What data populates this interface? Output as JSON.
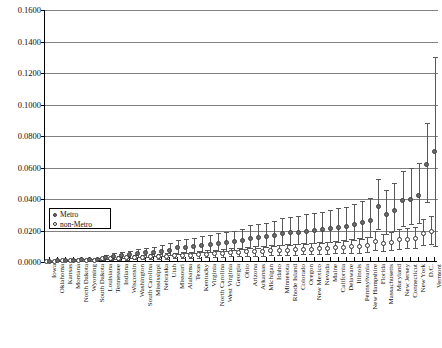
{
  "chart_data": {
    "type": "scatter",
    "title": "",
    "xlabel": "",
    "ylabel": "",
    "ylim": [
      0.0,
      0.16
    ],
    "yticks": [
      0.0,
      0.02,
      0.04,
      0.06,
      0.08,
      0.1,
      0.12,
      0.14,
      0.16
    ],
    "ytick_labels": [
      "0.0000",
      "0.0200",
      "0.0400",
      "0.0600",
      "0.0800",
      "0.1000",
      "0.1200",
      "0.1400",
      "0.1600"
    ],
    "grid": true,
    "legend_position": "inner-left",
    "legend": [
      "Metro",
      "non-Metro"
    ],
    "categories": [
      "Iowa",
      "Oklahoma",
      "Kansas",
      "Montana",
      "North Dakota",
      "Wyoming",
      "South Dakota",
      "Louisiana",
      "Tennessee",
      "Indiana",
      "Wisconsin",
      "Washington",
      "South Carolina",
      "Mississippi",
      "Nebraska",
      "Utah",
      "Missouri",
      "Alabama",
      "Texas",
      "Kentucky",
      "Virginia",
      "North Carolina",
      "West Virginia",
      "Georgia",
      "Ohio",
      "Arizona",
      "Arkansas",
      "Michigan",
      "Idaho",
      "Minnesota",
      "Rhode Island",
      "Colorado",
      "Oregon",
      "New Mexico",
      "Nevada",
      "Maine",
      "California",
      "Delaware",
      "Illinois",
      "Pennsylvania",
      "New Hampshire",
      "Florida",
      "Massachusetts",
      "Maryland",
      "New Jersey",
      "Connecticut",
      "New York",
      "D.C.",
      "Vermont"
    ],
    "series": [
      {
        "name": "Metro",
        "marker": "filled-circle",
        "color": "#6b6b6b",
        "values": [
          0.0005,
          0.0008,
          0.001,
          0.0012,
          0.0013,
          0.0015,
          0.0016,
          0.003,
          0.0035,
          0.004,
          0.0045,
          0.0052,
          0.0058,
          0.0062,
          0.0068,
          0.0075,
          0.009,
          0.0095,
          0.01,
          0.0105,
          0.0112,
          0.0118,
          0.0122,
          0.013,
          0.0138,
          0.015,
          0.0155,
          0.0162,
          0.0168,
          0.018,
          0.0185,
          0.019,
          0.0195,
          0.02,
          0.0205,
          0.0212,
          0.022,
          0.0228,
          0.0238,
          0.025,
          0.0262,
          0.035,
          0.03,
          0.033,
          0.039,
          0.04,
          0.042,
          0.062,
          0.07
        ],
        "err_low": [
          0.0003,
          0.0005,
          0.0006,
          0.0007,
          0.0008,
          0.0009,
          0.001,
          0.0018,
          0.002,
          0.0024,
          0.0026,
          0.003,
          0.0034,
          0.0036,
          0.004,
          0.0044,
          0.0052,
          0.0056,
          0.006,
          0.0062,
          0.0066,
          0.007,
          0.0072,
          0.0078,
          0.0082,
          0.009,
          0.0092,
          0.0096,
          0.01,
          0.0108,
          0.011,
          0.0114,
          0.0116,
          0.012,
          0.0122,
          0.0126,
          0.013,
          0.0136,
          0.0142,
          0.0148,
          0.0156,
          0.021,
          0.018,
          0.0198,
          0.023,
          0.024,
          0.025,
          0.038,
          0.01
        ],
        "err_high": [
          0.0008,
          0.0012,
          0.0015,
          0.0018,
          0.002,
          0.0022,
          0.0024,
          0.0046,
          0.0054,
          0.0062,
          0.007,
          0.008,
          0.009,
          0.0096,
          0.0105,
          0.0118,
          0.014,
          0.0148,
          0.0155,
          0.0163,
          0.0172,
          0.0182,
          0.019,
          0.02,
          0.0212,
          0.0232,
          0.024,
          0.025,
          0.026,
          0.0278,
          0.0286,
          0.0294,
          0.0302,
          0.031,
          0.0318,
          0.0328,
          0.034,
          0.0352,
          0.0368,
          0.0386,
          0.0405,
          0.053,
          0.046,
          0.05,
          0.058,
          0.0595,
          0.063,
          0.088,
          0.13
        ]
      },
      {
        "name": "non-Metro",
        "marker": "open-circle",
        "color": "#ffffff",
        "values": [
          0.0004,
          0.0006,
          0.0008,
          0.0009,
          0.001,
          0.0011,
          0.0012,
          0.002,
          0.0022,
          0.0024,
          0.0026,
          0.0028,
          0.003,
          0.0032,
          0.0034,
          0.0036,
          0.004,
          0.0042,
          0.0044,
          0.0046,
          0.005,
          0.0052,
          0.0054,
          0.0058,
          0.006,
          0.0064,
          0.0066,
          0.0068,
          0.007,
          0.0074,
          0.0076,
          0.0078,
          0.008,
          0.0082,
          0.0084,
          0.0086,
          0.009,
          0.0092,
          0.0096,
          0.01,
          0.0104,
          0.013,
          0.012,
          0.0126,
          0.014,
          0.0145,
          0.015,
          0.018,
          0.0195
        ],
        "err_low": [
          0.0002,
          0.0003,
          0.0004,
          0.0005,
          0.0005,
          0.0006,
          0.0006,
          0.0012,
          0.0013,
          0.0014,
          0.0015,
          0.0017,
          0.0018,
          0.0019,
          0.002,
          0.0022,
          0.0024,
          0.0025,
          0.0026,
          0.0028,
          0.003,
          0.0031,
          0.0032,
          0.0035,
          0.0036,
          0.0038,
          0.004,
          0.0041,
          0.0042,
          0.0044,
          0.0046,
          0.0047,
          0.0048,
          0.0049,
          0.005,
          0.0052,
          0.0054,
          0.0055,
          0.0058,
          0.006,
          0.0062,
          0.0078,
          0.0072,
          0.0076,
          0.0084,
          0.0087,
          0.009,
          0.0108,
          0.0117
        ],
        "err_high": [
          0.0006,
          0.0009,
          0.0012,
          0.0013,
          0.0015,
          0.0016,
          0.0018,
          0.003,
          0.0033,
          0.0036,
          0.0039,
          0.0042,
          0.0045,
          0.0048,
          0.0051,
          0.0054,
          0.006,
          0.0063,
          0.0066,
          0.0069,
          0.0075,
          0.0078,
          0.0081,
          0.0087,
          0.009,
          0.0096,
          0.0099,
          0.0102,
          0.0105,
          0.0111,
          0.0114,
          0.0117,
          0.012,
          0.0123,
          0.0126,
          0.0129,
          0.0135,
          0.0138,
          0.0144,
          0.015,
          0.0156,
          0.0195,
          0.018,
          0.0189,
          0.021,
          0.0218,
          0.0225,
          0.027,
          0.0293
        ]
      }
    ]
  }
}
